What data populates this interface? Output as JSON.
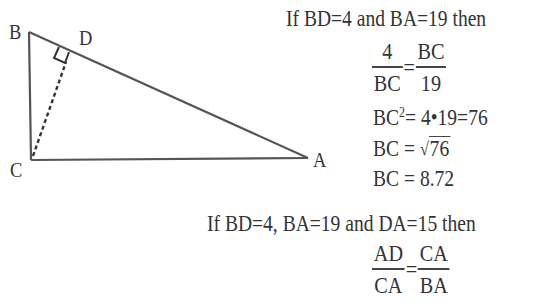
{
  "diagram": {
    "vertices": {
      "B": {
        "label": "B"
      },
      "D": {
        "label": "D"
      },
      "C": {
        "label": "C"
      },
      "A": {
        "label": "A"
      }
    },
    "line_color": "#555555",
    "altitude_style": "dashed",
    "right_angle_at": "D"
  },
  "part1": {
    "intro": "If BD=4 and BA=19 then",
    "fraction_eq": {
      "left_num": "4",
      "left_den": "BC",
      "eq": "=",
      "right_num": "BC",
      "right_den": "19"
    },
    "step1": {
      "lhs": "BC",
      "exp": "2",
      "rhs": "= 4•19=76"
    },
    "step2": {
      "lhs": "BC =",
      "radicand": "76",
      "radical": "√"
    },
    "step3": "BC = 8.72"
  },
  "part2": {
    "intro": "If BD=4, BA=19 and DA=15 then",
    "fraction_eq": {
      "left_num": "AD",
      "left_den": "CA",
      "eq": "=",
      "right_num": "CA",
      "right_den": "BA"
    }
  }
}
